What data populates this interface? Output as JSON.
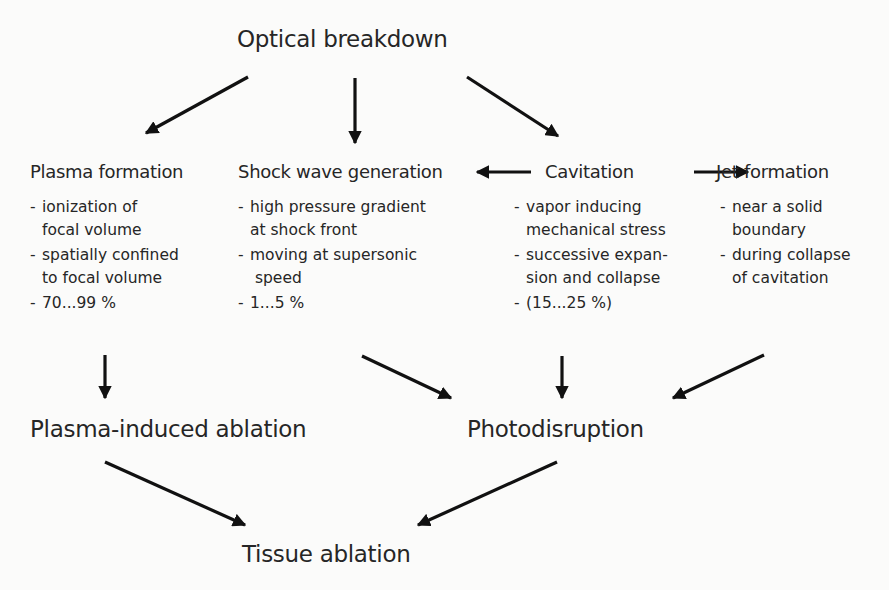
{
  "diagram": {
    "root": "Optical breakdown",
    "mechanisms": [
      {
        "title": "Plasma formation",
        "items": [
          "ionization of\nfocal volume",
          "spatially confined\nto focal volume"
        ],
        "share": "70...99 %"
      },
      {
        "title": "Shock wave generation",
        "items": [
          "high pressure gradient\nat shock front",
          "moving at supersonic\n speed"
        ],
        "share": "1...5 %"
      },
      {
        "title": "Cavitation",
        "items": [
          "vapor inducing\nmechanical stress",
          "successive expan-\nsion and collapse"
        ],
        "share": "(15...25 %)"
      },
      {
        "title": "Jet formation",
        "items": [
          "near a solid\nboundary",
          "during collapse\nof cavitation"
        ]
      }
    ],
    "effects": [
      "Plasma-induced ablation",
      "Photodisruption"
    ],
    "outcome": "Tissue ablation",
    "arrow_color": "#111111",
    "edges": [
      {
        "from": "Optical breakdown",
        "to": "Plasma formation"
      },
      {
        "from": "Optical breakdown",
        "to": "Shock wave generation"
      },
      {
        "from": "Optical breakdown",
        "to": "Cavitation"
      },
      {
        "from": "Cavitation",
        "to": "Shock wave generation"
      },
      {
        "from": "Cavitation",
        "to": "Jet formation"
      },
      {
        "from": "Plasma formation",
        "to": "Plasma-induced ablation"
      },
      {
        "from": "Shock wave generation",
        "to": "Photodisruption"
      },
      {
        "from": "Cavitation",
        "to": "Photodisruption"
      },
      {
        "from": "Jet formation",
        "to": "Photodisruption"
      },
      {
        "from": "Plasma-induced ablation",
        "to": "Tissue ablation"
      },
      {
        "from": "Photodisruption",
        "to": "Tissue ablation"
      }
    ]
  }
}
